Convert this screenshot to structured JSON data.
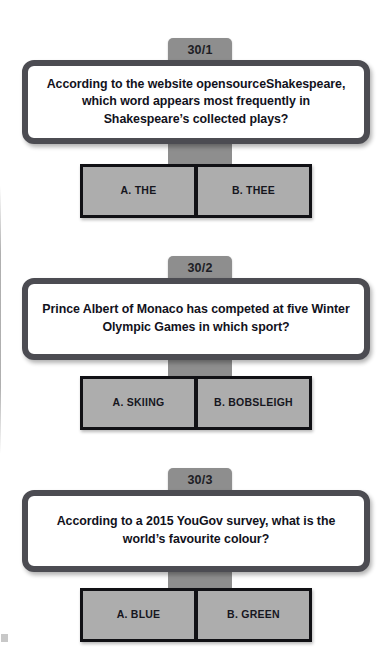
{
  "sheet": {
    "questions": [
      {
        "number": "30/1",
        "text": "According to the website opensourceShakespeare, which word appears most frequently in Shakespeare’s collected plays?",
        "answers": [
          {
            "label": "A. THE"
          },
          {
            "label": "B. THEE"
          }
        ]
      },
      {
        "number": "30/2",
        "text": "Prince Albert of Monaco has competed at five Winter Olympic Games in which sport?",
        "answers": [
          {
            "label": "A. SKIING"
          },
          {
            "label": "B. BOBSLEIGH"
          }
        ]
      },
      {
        "number": "30/3",
        "text": "According to a 2015 YouGov survey, what is the world’s favourite colour?",
        "answers": [
          {
            "label": "A. BLUE"
          },
          {
            "label": "B. GREEN"
          }
        ]
      }
    ]
  },
  "colors": {
    "tab_gray": "#8e8e8e",
    "card_border": "#4c4c52",
    "card_fill": "#ffffff",
    "button_fill": "#adadad",
    "button_frame": "#111115",
    "text_dark": "#12121c"
  }
}
